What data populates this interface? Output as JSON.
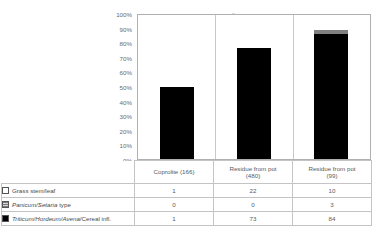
{
  "chart_data": {
    "type": "bar",
    "subtype": "100% stacked column",
    "title": "",
    "xlabel": "",
    "ylabel": "",
    "ylim": [
      0,
      100
    ],
    "ytick_labels": [
      "0%",
      "10%",
      "20%",
      "30%",
      "40%",
      "50%",
      "60%",
      "70%",
      "80%",
      "90%",
      "100%"
    ],
    "ytick_values": [
      0,
      10,
      20,
      30,
      40,
      50,
      60,
      70,
      80,
      90,
      100
    ],
    "grid": false,
    "legend_position": "data-table-left",
    "categories": [
      "Coprolite (166)",
      "Residue from pot (480)",
      "Residue from pot (99)"
    ],
    "category_lines": [
      [
        "Coprolite (166)"
      ],
      [
        "Residue from pot",
        "(480)"
      ],
      [
        "Residue from pot",
        "(99)"
      ]
    ],
    "series": [
      {
        "name": "Grass stem/leaf",
        "name_parts": [
          {
            "text": "Grass stem/leaf",
            "italic": false
          }
        ],
        "color": "#ffffff",
        "swatch": "sw-white",
        "values": [
          1,
          22,
          10
        ],
        "percents": [
          50.0,
          23.2,
          10.3
        ]
      },
      {
        "name": "Panicum/Setaria type",
        "name_parts": [
          {
            "text": "Panicum/Setaria",
            "italic": true
          },
          {
            "text": " type",
            "italic": false
          }
        ],
        "color": "#808080",
        "swatch": "sw-gray",
        "values": [
          0,
          0,
          3
        ],
        "percents": [
          0.0,
          0.0,
          3.1
        ]
      },
      {
        "name": "Triticum/Hordeum/Avena/Cereal infl.",
        "name_parts": [
          {
            "text": "Triticum/Hordeum/Avena",
            "italic": true
          },
          {
            "text": "/Cereal infl.",
            "italic": false
          }
        ],
        "color": "#000000",
        "swatch": "sw-black",
        "values": [
          1,
          73,
          84
        ],
        "percents": [
          50.0,
          76.8,
          86.6
        ]
      }
    ],
    "column_totals": [
      2,
      95,
      97
    ]
  },
  "table": {
    "corner_label": "",
    "row_labels": [
      "Grass stem/leaf",
      "Panicum/Setaria type",
      "Triticum/Hordeum/Avena/Cereal infl."
    ],
    "rows": [
      [
        "1",
        "22",
        "10"
      ],
      [
        "0",
        "0",
        "3"
      ],
      [
        "1",
        "73",
        "84"
      ]
    ]
  },
  "caption": ""
}
